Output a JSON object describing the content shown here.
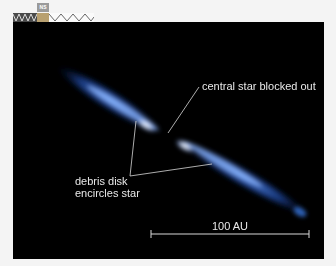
{
  "toolbar": {
    "nav_widget_label": "NS",
    "icons": [
      "ruler-strip",
      "navigation-arrow-icon"
    ]
  },
  "figure": {
    "background_color": "#000000",
    "disk_color": "#2f6fd6",
    "disk_core_color": "#ffffff",
    "annotations": {
      "central_star": "central star blocked out",
      "debris_disk_line1": "debris disk",
      "debris_disk_line2": "encircles star"
    },
    "scale_bar": {
      "label": "100 AU"
    }
  }
}
